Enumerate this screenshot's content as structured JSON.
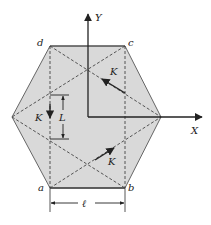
{
  "diagram": {
    "colors": {
      "fill": "#d9d9d9",
      "edge": "#555555",
      "line": "#222222"
    },
    "axes": {
      "y_label": "Y",
      "x_label": "X"
    },
    "vertices": {
      "a": "a",
      "b": "b",
      "c": "c",
      "d": "d"
    },
    "vectors": [
      {
        "label": "K",
        "position": "upper-right, pointing up-left"
      },
      {
        "label": "K",
        "position": "left, pointing down"
      },
      {
        "label": "K",
        "position": "lower-right, pointing up-right"
      }
    ],
    "dimensions": {
      "vertical": "L",
      "horizontal": "ℓ"
    }
  }
}
